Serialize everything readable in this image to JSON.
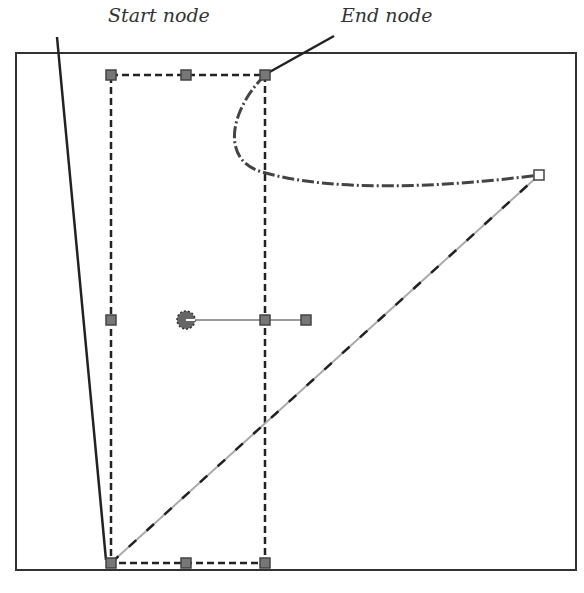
{
  "labels": {
    "start_node": "Start node",
    "end_node": "End node"
  },
  "colors": {
    "frame": "#333333",
    "path": "#333333",
    "handle_fill": "#777777",
    "guide": "#999999"
  },
  "frame": {
    "x": 16,
    "y": 53,
    "width": 560,
    "height": 517
  },
  "bounding_box": {
    "x": 111,
    "y": 75,
    "width": 154,
    "height": 488
  },
  "nodes": {
    "start": {
      "x": 111,
      "y": 563
    },
    "end": {
      "x": 265,
      "y": 75
    },
    "corner": {
      "x": 539,
      "y": 175
    }
  },
  "rotation_center": {
    "x": 186,
    "y": 320
  },
  "rotation_handle": {
    "x": 306,
    "y": 320
  }
}
